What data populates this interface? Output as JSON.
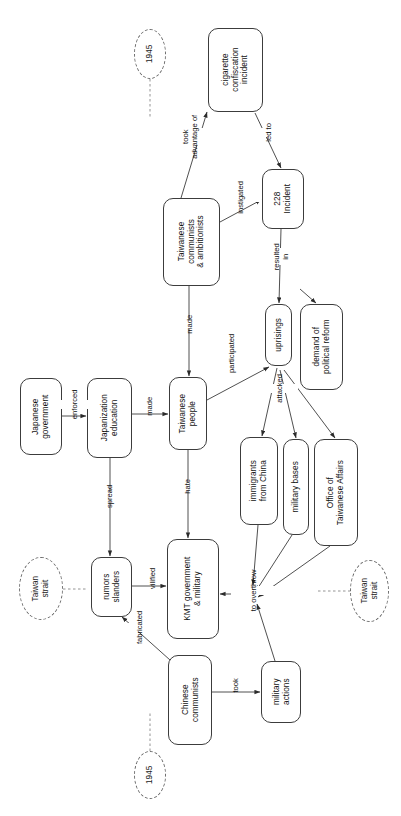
{
  "diagram": {
    "orientation": "text rotated 90 degrees counter-clockwise",
    "stroke_color": "#3c3c3c",
    "background": "#ffffff",
    "nodes": [
      {
        "id": "cigarette",
        "label": "cigarette\nconfiscation\nincident",
        "shape": "rounded-rect"
      },
      {
        "id": "tw_comm",
        "label": "Taiwanese\ncommunists\n& ambitionists",
        "shape": "rounded-rect"
      },
      {
        "id": "incident228",
        "label": "228\nIncident",
        "shape": "rounded-rect"
      },
      {
        "id": "uprisings",
        "label": "uprisings",
        "shape": "rounded-rect"
      },
      {
        "id": "demand",
        "label": "demand of\npolitical reform",
        "shape": "rounded-rect"
      },
      {
        "id": "jp_gov",
        "label": "Japanese\ngovernment",
        "shape": "rounded-rect"
      },
      {
        "id": "jp_edu",
        "label": "Japanization\neducation",
        "shape": "rounded-rect"
      },
      {
        "id": "tw_people",
        "label": "Taiwanese\npeople",
        "shape": "rounded-rect"
      },
      {
        "id": "immigrants",
        "label": "immigrants\nfrom China",
        "shape": "rounded-rect"
      },
      {
        "id": "mil_bases",
        "label": "military bases",
        "shape": "rounded-rect"
      },
      {
        "id": "office",
        "label": "Office of\nTaiwanese Affairs",
        "shape": "rounded-rect"
      },
      {
        "id": "rumors",
        "label": "rumors\nslanders",
        "shape": "rounded-rect"
      },
      {
        "id": "kmt",
        "label": "KMT government\n& military",
        "shape": "rounded-rect"
      },
      {
        "id": "cn_comm",
        "label": "Chinese\ncommunists",
        "shape": "rounded-rect"
      },
      {
        "id": "mil_actions",
        "label": "military\nactions",
        "shape": "rounded-rect"
      }
    ],
    "annotations": [
      {
        "id": "year_top",
        "label": "1945",
        "shape": "dashed-ellipse"
      },
      {
        "id": "strait_left",
        "label": "Taiwan\nstrait",
        "shape": "dashed-ellipse"
      },
      {
        "id": "strait_right",
        "label": "Taiwan\nstrait",
        "shape": "dashed-ellipse"
      },
      {
        "id": "year_bottom",
        "label": "1945",
        "shape": "dashed-ellipse"
      }
    ],
    "edges": [
      {
        "from": "tw_comm",
        "to": "cigarette",
        "label": "took\nadvantage of"
      },
      {
        "from": "cigarette",
        "to": "incident228",
        "label": "led to"
      },
      {
        "from": "tw_comm",
        "to": "incident228",
        "label": "instigated"
      },
      {
        "from": "incident228",
        "to": "uprisings",
        "label": "resulted\nin"
      },
      {
        "from": "uprisings",
        "to": "demand",
        "label": ""
      },
      {
        "from": "tw_comm",
        "to": "tw_people",
        "label": "made"
      },
      {
        "from": "jp_gov",
        "to": "jp_edu",
        "label": "enforced"
      },
      {
        "from": "jp_edu",
        "to": "tw_people",
        "label": "made"
      },
      {
        "from": "jp_edu",
        "to": "rumors",
        "label": "spread"
      },
      {
        "from": "tw_people",
        "to": "uprisings",
        "label": "participated"
      },
      {
        "from": "tw_people",
        "to": "kmt",
        "label": "hate"
      },
      {
        "from": "uprisings",
        "to": "immigrants",
        "label": "attacked"
      },
      {
        "from": "uprisings",
        "to": "mil_bases",
        "label": "attacked"
      },
      {
        "from": "uprisings",
        "to": "office",
        "label": "attacked"
      },
      {
        "from": "rumors",
        "to": "kmt",
        "label": "vilified"
      },
      {
        "from": "cn_comm",
        "to": "rumors",
        "label": "fabricated"
      },
      {
        "from": "cn_comm",
        "to": "mil_actions",
        "label": "took"
      },
      {
        "from": "immigrants",
        "to": "kmt",
        "label": "to overthrow"
      },
      {
        "from": "mil_bases",
        "to": "kmt",
        "label": "to overthrow"
      },
      {
        "from": "office",
        "to": "kmt",
        "label": "to overthrow"
      },
      {
        "from": "mil_actions",
        "to": "kmt",
        "label": "to overthrow"
      }
    ],
    "labels": {
      "took_advantage_of": "took\nadvantage of",
      "led_to": "led to",
      "instigated": "instigated",
      "resulted_in": "resulted\nin",
      "made_comm": "made",
      "enforced": "enforced",
      "made_edu": "made",
      "spread": "spread",
      "participated": "participated",
      "hate": "hate",
      "attacked": "attacked",
      "vilified": "vilified",
      "fabricated": "fabricated",
      "took": "took",
      "to_overthrow": "to overthrow"
    },
    "node_text": {
      "cigarette_l1": "cigarette",
      "cigarette_l2": "confiscation",
      "cigarette_l3": "incident",
      "tw_comm_l1": "Taiwanese",
      "tw_comm_l2": "communists",
      "tw_comm_l3": "& ambitionists",
      "incident228_l1": "228",
      "incident228_l2": "Incident",
      "uprisings_l1": "uprisings",
      "demand_l1": "demand of",
      "demand_l2": "political reform",
      "jp_gov_l1": "Japanese",
      "jp_gov_l2": "government",
      "jp_edu_l1": "Japanization",
      "jp_edu_l2": "education",
      "tw_people_l1": "Taiwanese",
      "tw_people_l2": "people",
      "immigrants_l1": "immigrants",
      "immigrants_l2": "from China",
      "mil_bases_l1": "military bases",
      "office_l1": "Office of",
      "office_l2": "Taiwanese Affairs",
      "rumors_l1": "rumors",
      "rumors_l2": "slanders",
      "kmt_l1": "KMT government",
      "kmt_l2": "& military",
      "cn_comm_l1": "Chinese",
      "cn_comm_l2": "communists",
      "mil_actions_l1": "military",
      "mil_actions_l2": "actions",
      "year_top": "1945",
      "strait_left_l1": "Taiwan",
      "strait_left_l2": "strait",
      "strait_right_l1": "Taiwan",
      "strait_right_l2": "strait",
      "year_bottom": "1945"
    }
  }
}
